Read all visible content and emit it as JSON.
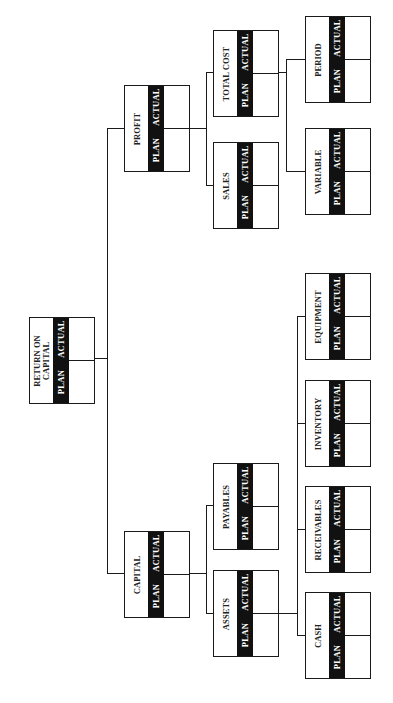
{
  "diagram": {
    "orientation": "rotated-90-ccw",
    "column_labels": {
      "plan": "PLAN",
      "actual": "ACTUAL"
    },
    "nodes": {
      "root": {
        "label_line1": "RETURN ON",
        "label_line2": "CAPITAL"
      },
      "profit": {
        "label": "PROFIT"
      },
      "sales": {
        "label": "SALES"
      },
      "total_cost": {
        "label": "TOTAL COST"
      },
      "variable": {
        "label": "VARIABLE"
      },
      "period": {
        "label": "PERIOD"
      },
      "capital": {
        "label": "CAPITAL"
      },
      "assets": {
        "label": "ASSETS"
      },
      "payables": {
        "label": "PAYABLES"
      },
      "cash": {
        "label": "CASH"
      },
      "receivables": {
        "label": "RECEIVABLES"
      },
      "inventory": {
        "label": "INVENTORY"
      },
      "equipment": {
        "label": "EQUIPMENT"
      }
    },
    "edges": [
      [
        "root",
        "profit"
      ],
      [
        "root",
        "capital"
      ],
      [
        "profit",
        "sales"
      ],
      [
        "profit",
        "total_cost"
      ],
      [
        "total_cost",
        "variable"
      ],
      [
        "total_cost",
        "period"
      ],
      [
        "capital",
        "assets"
      ],
      [
        "capital",
        "payables"
      ],
      [
        "assets",
        "cash"
      ],
      [
        "assets",
        "receivables"
      ],
      [
        "assets",
        "inventory"
      ],
      [
        "assets",
        "equipment"
      ]
    ],
    "colors": {
      "line": "#1a1a1a",
      "band": "#111111",
      "background": "#ffffff"
    }
  }
}
